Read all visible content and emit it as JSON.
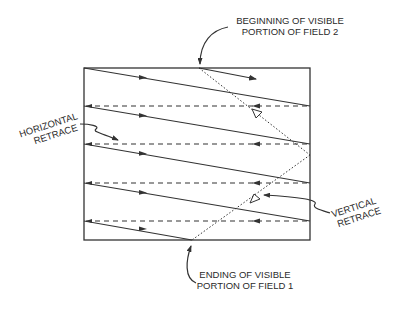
{
  "diagram": {
    "labels": {
      "field2_line1": "BEGINNING OF VISIBLE",
      "field2_line2": "PORTION OF FIELD 2",
      "field1_line1": "ENDING OF VISIBLE",
      "field1_line2": "PORTION OF FIELD 1",
      "hretrace_line1": "HORIZONTAL",
      "hretrace_line2": "RETRACE",
      "vretrace_line1": "VERTICAL",
      "vretrace_line2": "RETRACE"
    },
    "colors": {
      "stroke": "#333333",
      "background": "#ffffff"
    },
    "raster": {
      "left": 84,
      "top": 68,
      "right": 310,
      "bottom": 240
    },
    "scan_lines_count": 5,
    "retrace_lines_count": 4
  }
}
